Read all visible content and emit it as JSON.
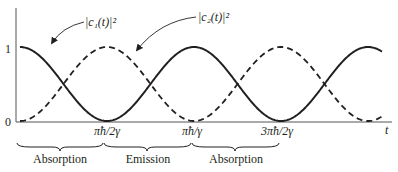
{
  "chart_data": {
    "type": "line",
    "title": "",
    "xlabel": "t",
    "ylabel": "",
    "ylim": [
      0,
      1
    ],
    "y_ticks": [
      "0",
      "1"
    ],
    "x_ticks": [
      "πħ/2γ",
      "πħ/γ",
      "3πħ/2γ"
    ],
    "x_tick_values": [
      1.5708,
      3.1416,
      4.7124
    ],
    "x_range": [
      0,
      6.3
    ],
    "series": [
      {
        "name": "|c1(t)|^2",
        "label": "|c₁(t)|²",
        "style": "solid",
        "formula": "cos^2(γt/ħ)",
        "x": [
          0,
          0.785,
          1.571,
          2.356,
          3.142,
          3.927,
          4.712,
          5.498,
          6.283
        ],
        "values": [
          1.0,
          0.5,
          0.0,
          0.5,
          1.0,
          0.5,
          0.0,
          0.5,
          1.0
        ]
      },
      {
        "name": "|c2(t)|^2",
        "label": "|c₂(t)|²",
        "style": "dashed",
        "formula": "sin^2(γt/ħ)",
        "x": [
          0,
          0.785,
          1.571,
          2.356,
          3.142,
          3.927,
          4.712,
          5.498,
          6.283
        ],
        "values": [
          0.0,
          0.5,
          1.0,
          0.5,
          0.0,
          0.5,
          1.0,
          0.5,
          0.0
        ]
      }
    ],
    "annotations": [
      {
        "text": "|c₁(t)|²",
        "arrow_to": "solid curve"
      },
      {
        "text": "|c₂(t)|²",
        "arrow_to": "dashed curve"
      }
    ],
    "regions": [
      {
        "label": "Absorption",
        "from": "0",
        "to": "πħ/2γ"
      },
      {
        "label": "Emission",
        "from": "πħ/2γ",
        "to": "πħ/γ"
      },
      {
        "label": "Absorption",
        "from": "πħ/γ",
        "to": "3πħ/2γ"
      }
    ],
    "grid": false,
    "legend": "none"
  },
  "labels": {
    "y1": "1",
    "y0": "0",
    "c1": "|c₁(t)|²",
    "c2": "|c₂(t)|²",
    "tick1": "πħ/2γ",
    "tick2": "πħ/γ",
    "tick3": "3πħ/2γ",
    "xaxis": "t",
    "region1": "Absorption",
    "region2": "Emission",
    "region3": "Absorption"
  }
}
